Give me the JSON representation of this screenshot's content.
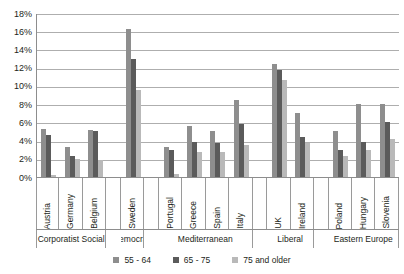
{
  "chart_data": {
    "type": "bar",
    "title": "",
    "subtitle": "",
    "xlabel": "",
    "ylabel": "",
    "ylim": [
      0,
      18
    ],
    "y_tick_suffix": "%",
    "yticks": [
      18,
      16,
      14,
      12,
      10,
      8,
      6,
      4,
      2,
      0
    ],
    "ytick_labels": [
      "18%",
      "16%",
      "14%",
      "12%",
      "10%",
      "8%",
      "6%",
      "4%",
      "2%",
      "0%"
    ],
    "grid": true,
    "legend_position": "bottom",
    "categories": [
      "Austria",
      "Germany",
      "Belgium",
      "Sweden",
      "Portugal",
      "Greece",
      "Spain",
      "Italy",
      "UK",
      "Ireland",
      "Poland",
      "Hungary",
      "Slovenia"
    ],
    "series": [
      {
        "name": "55 - 64",
        "color": "#8e8e8e",
        "values": [
          5.3,
          3.3,
          5.2,
          16.2,
          3.3,
          5.6,
          5.0,
          8.5,
          12.4,
          7.0,
          5.0,
          8.0,
          8.0
        ]
      },
      {
        "name": "65 - 75",
        "color": "#5b5b5b",
        "values": [
          4.6,
          2.3,
          5.1,
          12.9,
          3.0,
          3.8,
          3.7,
          5.8,
          11.8,
          4.4,
          3.0,
          3.8,
          6.0
        ]
      },
      {
        "name": "75 and older",
        "color": "#b9b9b9",
        "values": [
          0.2,
          2.0,
          1.9,
          9.6,
          0.3,
          2.8,
          2.8,
          3.5,
          10.6,
          3.7,
          2.3,
          3.0,
          4.2
        ]
      }
    ],
    "groups": [
      {
        "label": "Corporatist Social",
        "categories": [
          "Austria",
          "Germany",
          "Belgium"
        ]
      },
      {
        "label": "democrat",
        "categories": [
          "Sweden"
        ]
      },
      {
        "label": "Mediterranean",
        "categories": [
          "Portugal",
          "Greece",
          "Spain",
          "Italy"
        ]
      },
      {
        "label": "Liberal",
        "categories": [
          "UK",
          "Ireland"
        ]
      },
      {
        "label": "Eastern Europe",
        "categories": [
          "Poland",
          "Hungary",
          "Slovenia"
        ]
      }
    ]
  }
}
